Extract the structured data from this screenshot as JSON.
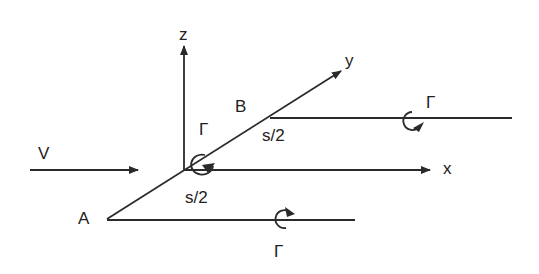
{
  "diagram": {
    "type": "horseshoe-vortex-coordinate-sketch",
    "colors": {
      "line": "#2a2a2a",
      "background": "#ffffff"
    },
    "axes": {
      "x_label": "x",
      "y_label": "y",
      "z_label": "z"
    },
    "points": {
      "A_label": "A",
      "B_label": "B"
    },
    "freestream": {
      "label": "V"
    },
    "segments": {
      "upper_half_span": "s/2",
      "lower_half_span": "s/2"
    },
    "vortices": {
      "bound_circulation": "Γ",
      "trailing_B_circulation": "Γ",
      "trailing_A_circulation": "Γ"
    }
  }
}
